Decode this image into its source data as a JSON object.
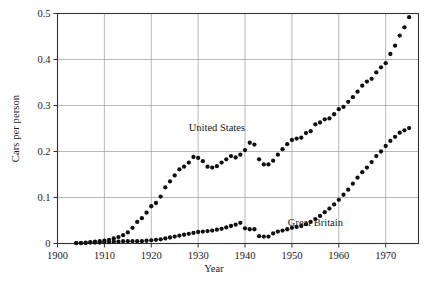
{
  "chart_data": {
    "type": "scatter",
    "title": "",
    "xlabel": "Year",
    "ylabel": "Cars per person",
    "xlim": [
      1900,
      1977
    ],
    "ylim": [
      0,
      0.5
    ],
    "grid": true,
    "legend_position": "inline-annotation",
    "xticks": [
      1900,
      1910,
      1920,
      1930,
      1940,
      1950,
      1960,
      1970
    ],
    "xtick_labels": [
      "1900",
      "1910",
      "1920",
      "1930",
      "1940",
      "1950",
      "1960",
      "1970"
    ],
    "yticks": [
      0,
      0.1,
      0.2,
      0.3,
      0.4,
      0.5
    ],
    "ytick_labels": [
      "0",
      "0.1",
      "0.2",
      "0.3",
      "0.4",
      "0.5"
    ],
    "series": [
      {
        "name": "United States",
        "annotation_label": "United States",
        "annotation_x": 1934,
        "annotation_y": 0.245,
        "marker": "circle",
        "color": "#101010",
        "x": [
          1904,
          1905,
          1906,
          1907,
          1908,
          1909,
          1910,
          1911,
          1912,
          1913,
          1914,
          1915,
          1916,
          1917,
          1918,
          1919,
          1920,
          1921,
          1922,
          1923,
          1924,
          1925,
          1926,
          1927,
          1928,
          1929,
          1930,
          1931,
          1932,
          1933,
          1934,
          1935,
          1936,
          1937,
          1938,
          1939,
          1940,
          1941,
          1942,
          1943,
          1944,
          1945,
          1946,
          1947,
          1948,
          1949,
          1950,
          1951,
          1952,
          1953,
          1954,
          1955,
          1956,
          1957,
          1958,
          1959,
          1960,
          1961,
          1962,
          1963,
          1964,
          1965,
          1966,
          1967,
          1968,
          1969,
          1970,
          1971,
          1972,
          1973,
          1974,
          1975
        ],
        "y": [
          0.001,
          0.001,
          0.002,
          0.003,
          0.004,
          0.005,
          0.006,
          0.008,
          0.011,
          0.014,
          0.018,
          0.024,
          0.034,
          0.047,
          0.055,
          0.067,
          0.081,
          0.088,
          0.102,
          0.122,
          0.135,
          0.148,
          0.161,
          0.167,
          0.176,
          0.188,
          0.186,
          0.179,
          0.167,
          0.165,
          0.168,
          0.176,
          0.183,
          0.19,
          0.187,
          0.193,
          0.203,
          0.219,
          0.215,
          0.183,
          0.172,
          0.172,
          0.18,
          0.193,
          0.205,
          0.216,
          0.225,
          0.228,
          0.23,
          0.24,
          0.244,
          0.259,
          0.263,
          0.27,
          0.272,
          0.281,
          0.292,
          0.297,
          0.308,
          0.318,
          0.33,
          0.343,
          0.352,
          0.358,
          0.372,
          0.383,
          0.392,
          0.412,
          0.43,
          0.452,
          0.47,
          0.492
        ]
      },
      {
        "name": "Great Britain",
        "annotation_label": "Great Britain",
        "annotation_x": 1955,
        "annotation_y": 0.037,
        "marker": "circle",
        "color": "#101010",
        "x": [
          1904,
          1905,
          1906,
          1907,
          1908,
          1909,
          1910,
          1911,
          1912,
          1913,
          1914,
          1915,
          1916,
          1917,
          1918,
          1919,
          1920,
          1921,
          1922,
          1923,
          1924,
          1925,
          1926,
          1927,
          1928,
          1929,
          1930,
          1931,
          1932,
          1933,
          1934,
          1935,
          1936,
          1937,
          1938,
          1939,
          1940,
          1941,
          1942,
          1943,
          1944,
          1945,
          1946,
          1947,
          1948,
          1949,
          1950,
          1951,
          1952,
          1953,
          1954,
          1955,
          1956,
          1957,
          1958,
          1959,
          1960,
          1961,
          1962,
          1963,
          1964,
          1965,
          1966,
          1967,
          1968,
          1969,
          1970,
          1971,
          1972,
          1973,
          1974,
          1975
        ],
        "y": [
          0.001,
          0.001,
          0.001,
          0.002,
          0.002,
          0.002,
          0.003,
          0.003,
          0.004,
          0.004,
          0.005,
          0.005,
          0.005,
          0.005,
          0.005,
          0.006,
          0.007,
          0.008,
          0.009,
          0.011,
          0.013,
          0.015,
          0.017,
          0.019,
          0.021,
          0.023,
          0.025,
          0.026,
          0.027,
          0.028,
          0.03,
          0.032,
          0.035,
          0.038,
          0.041,
          0.045,
          0.033,
          0.031,
          0.031,
          0.016,
          0.015,
          0.015,
          0.022,
          0.026,
          0.028,
          0.031,
          0.034,
          0.036,
          0.038,
          0.042,
          0.047,
          0.053,
          0.06,
          0.068,
          0.076,
          0.085,
          0.095,
          0.106,
          0.117,
          0.13,
          0.143,
          0.155,
          0.165,
          0.177,
          0.19,
          0.2,
          0.212,
          0.223,
          0.232,
          0.241,
          0.246,
          0.251
        ]
      }
    ]
  },
  "figure": {
    "ylabel_text": "Cars per person",
    "xlabel_text": "Year"
  }
}
